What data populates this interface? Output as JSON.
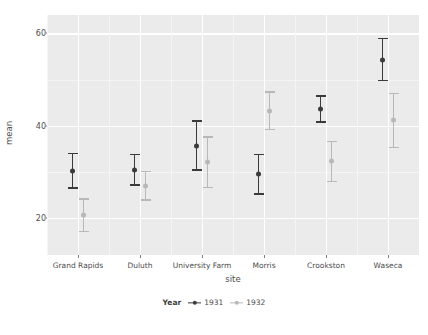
{
  "chart_data": {
    "type": "scatter",
    "title": "",
    "xlabel": "site",
    "ylabel": "mean",
    "categories": [
      "Grand Rapids",
      "Duluth",
      "University Farm",
      "Morris",
      "Crookston",
      "Waseca"
    ],
    "ylim": [
      12,
      64
    ],
    "yticks": [
      20,
      40,
      60
    ],
    "ytick_labels": [
      "20",
      "40",
      "60"
    ],
    "grid": true,
    "legend_position": "bottom",
    "legend_title": "Year",
    "series": [
      {
        "name": "1931",
        "color": "#3b3b3b",
        "values": [
          30.3,
          30.5,
          35.7,
          29.5,
          43.7,
          54.3
        ],
        "lower": [
          26.4,
          27.0,
          30.3,
          25.1,
          40.7,
          49.6
        ],
        "upper": [
          34.2,
          33.9,
          41.2,
          33.9,
          46.6,
          59.1
        ]
      },
      {
        "name": "1932",
        "color": "#b8b8b8",
        "values": [
          20.6,
          27.0,
          32.1,
          43.2,
          32.3,
          41.2
        ],
        "lower": [
          17.0,
          23.8,
          26.5,
          39.0,
          27.8,
          35.2
        ],
        "upper": [
          24.3,
          30.2,
          37.7,
          47.5,
          36.7,
          47.2
        ]
      }
    ]
  },
  "axis": {
    "y_title": "mean",
    "x_title": "site"
  },
  "legend": {
    "title": "Year",
    "items": [
      {
        "label": "1931",
        "color": "#3b3b3b"
      },
      {
        "label": "1932",
        "color": "#b8b8b8"
      }
    ]
  },
  "style": {
    "panel_bg": "#ebebeb",
    "grid_major": "#ffffff",
    "grid_minor": "#f5f5f5",
    "text": "#4d4d4d",
    "page_bg": "#ffffff"
  }
}
